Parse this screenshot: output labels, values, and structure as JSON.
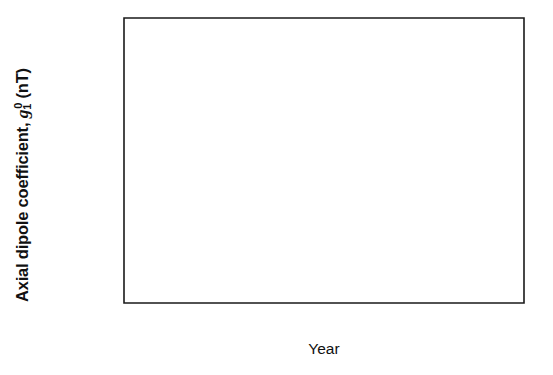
{
  "chart_data": {
    "type": "line",
    "title": "",
    "xlabel": "Year",
    "ylabel": "Axial dipole coefficient, g 1 0 (nT)",
    "ylabel_parts": {
      "prefix": "Axial dipole coefficient, ",
      "symbol": "g",
      "sub": "1",
      "sup": "0",
      "suffix": " (nT)"
    },
    "xlim": [
      1500,
      2000
    ],
    "ylim": [
      -37080,
      -29000
    ],
    "grid": false,
    "legend": "none",
    "xticks": [
      1500,
      1600,
      1700,
      1800,
      1900,
      2000
    ],
    "xtick_labels": [
      "1500",
      "1600",
      "1700",
      "1800",
      "1900",
      "2000"
    ],
    "xminor_ticks": [
      1550,
      1650,
      1750,
      1850,
      1950
    ],
    "yticks": [
      -30000,
      -32000,
      -34000,
      -36000
    ],
    "ytick_labels": [
      "−30000",
      "−32000",
      "−34000",
      "−36000"
    ],
    "yminor_ticks": [
      -31000,
      -33000,
      -35000,
      -37000
    ],
    "series": [
      {
        "name": "gufm1 / observatory axial dipole (solid)",
        "style": "solid",
        "color": "#111111",
        "x": [
          1585,
          1640,
          1700,
          1760,
          1800,
          1830,
          1855,
          1868,
          1880,
          1895,
          1910,
          1925,
          1935,
          1945,
          1958,
          1970,
          1982,
          1994
        ],
        "y": [
          -32780,
          -32660,
          -32540,
          -32400,
          -32290,
          -32200,
          -32130,
          -32090,
          -31930,
          -31700,
          -31480,
          -31220,
          -31060,
          -30900,
          -30690,
          -30440,
          -30140,
          -29830
        ]
      },
      {
        "name": "archeomagnetic dipole extrapolation (dashed)",
        "style": "dashed",
        "color": "#111111",
        "x": [
          1590,
          1650,
          1700,
          1750,
          1800,
          1840
        ],
        "y": [
          -36050,
          -35160,
          -34420,
          -33670,
          -32920,
          -32330
        ]
      }
    ]
  },
  "figure": {
    "background": "#ffffff",
    "axis_color": "#1a1a1a"
  }
}
